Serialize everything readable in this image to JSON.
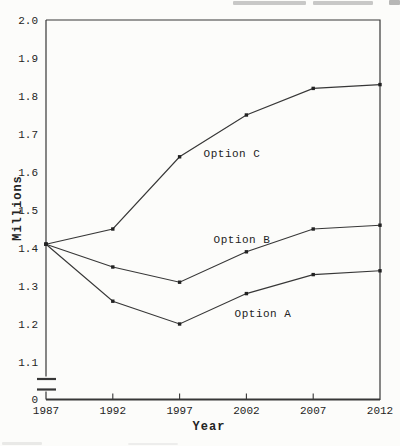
{
  "figure": {
    "kind": "scanned-book-line-chart",
    "background": "#fcfcfa",
    "ink_color": "#373737",
    "text_color": "#242424"
  },
  "chart_data": {
    "type": "line",
    "title": "",
    "xlabel": "Year",
    "ylabel": "Millions",
    "x": [
      1987,
      1992,
      1997,
      2002,
      2007,
      2012
    ],
    "series": [
      {
        "name": "Option C",
        "values": [
          1.41,
          1.45,
          1.64,
          1.75,
          1.82,
          1.83
        ]
      },
      {
        "name": "Option B",
        "values": [
          1.41,
          1.35,
          1.31,
          1.39,
          1.45,
          1.46
        ]
      },
      {
        "name": "Option A",
        "values": [
          1.41,
          1.26,
          1.2,
          1.28,
          1.33,
          1.34
        ]
      }
    ],
    "x_tick_labels": [
      "1987",
      "1992",
      "1997",
      "2002",
      "2007",
      "2012"
    ],
    "y_tick_labels": [
      "2.0",
      "1.9",
      "1.8",
      "1.7",
      "1.6",
      "1.5",
      "1.4",
      "1.3",
      "1.2",
      "1.1"
    ],
    "y_origin_label": "0",
    "ylim": [
      1.1,
      2.0
    ],
    "xlim": [
      1987,
      2012
    ],
    "axis_break": true,
    "grid": false,
    "legend": "inline-series-labels",
    "marker": "square",
    "line_color": "#373737"
  }
}
